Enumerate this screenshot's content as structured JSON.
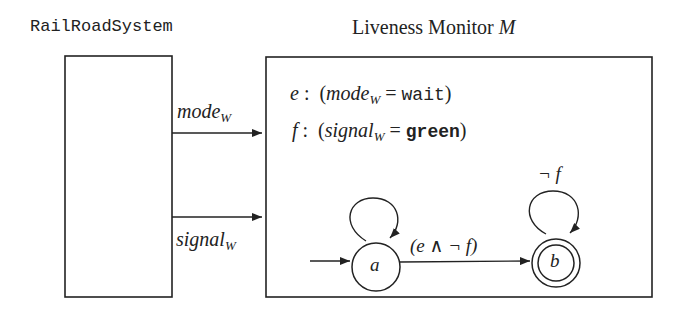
{
  "system": {
    "title": "RailRoadSystem"
  },
  "monitor": {
    "title": "Liveness Monitor",
    "title_symbol": "M",
    "defs": [
      {
        "name": "e",
        "var": "mode",
        "sub": "W",
        "value": "wait"
      },
      {
        "name": "f",
        "var": "signal",
        "sub": "W",
        "value": "green"
      }
    ]
  },
  "signals": [
    {
      "label": "mode",
      "sub": "W"
    },
    {
      "label": "signal",
      "sub": "W"
    }
  ],
  "automaton": {
    "states": [
      {
        "id": "a",
        "label": "a",
        "initial": true,
        "accepting": false
      },
      {
        "id": "b",
        "label": "b",
        "initial": false,
        "accepting": true
      }
    ],
    "transitions": [
      {
        "from": "a",
        "to": "a",
        "label": ""
      },
      {
        "from": "a",
        "to": "b",
        "label": "(e ∧ ¬ f)"
      },
      {
        "from": "b",
        "to": "b",
        "label": "¬ f"
      }
    ]
  }
}
